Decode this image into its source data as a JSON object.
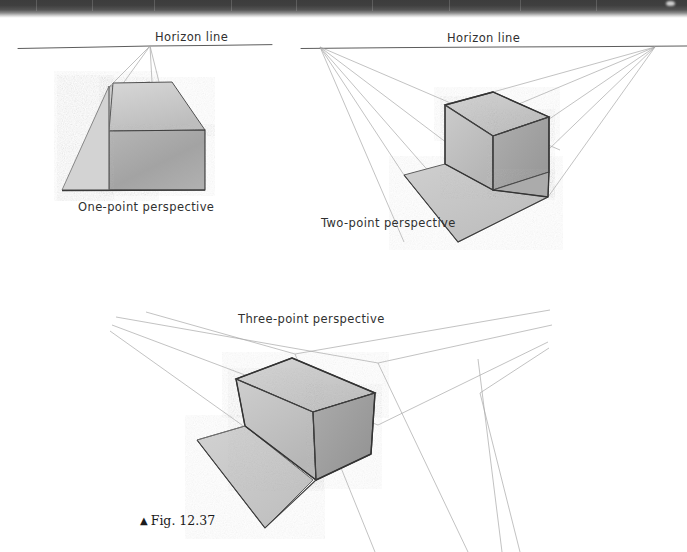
{
  "page": {
    "width": 687,
    "height": 552,
    "background": "#ffffff",
    "scan_edge_color": "#3c3c3c"
  },
  "figure": {
    "caption_marker": "▲",
    "caption_text": "Fig. 12.37",
    "caption_full": "▲ Fig. 12.37"
  },
  "diagrams": [
    {
      "id": "one-point",
      "label": "One-point perspective",
      "horizon_label": "Horizon line",
      "vanishing_points": 1,
      "label_x": 78,
      "label_y": 202,
      "horizon_label_x": 155,
      "horizon_label_y": 30
    },
    {
      "id": "two-point",
      "label": "Two-point perspective",
      "horizon_label": "Horizon line",
      "vanishing_points": 2,
      "label_x": 321,
      "label_y": 218,
      "horizon_label_x": 447,
      "horizon_label_y": 31
    },
    {
      "id": "three-point",
      "label": "Three-point perspective",
      "horizon_label": null,
      "vanishing_points": 3,
      "label_x": 240,
      "label_y": 313
    }
  ],
  "palette": {
    "paper": "#ffffff",
    "pencil_line": "#3a3a3a",
    "construction_line": "#9a9a9a",
    "face_light": "#d2d2d2",
    "face_mid": "#bfbfbf",
    "face_dark": "#a8a8a8",
    "face_darker": "#9c9c9c",
    "ground_plane": "#c6c6c6",
    "ink": "#2b2b2b"
  },
  "shading": {
    "one_point_top_face": "#c9c9c9",
    "one_point_front_face": "#a9a9a9",
    "one_point_left_face": "#cfcfcf",
    "two_point_top_face": "#c6c6c6",
    "two_point_front_face": "#c0c0c0",
    "two_point_right_face": "#a6a6a6",
    "two_point_ground": "#c4c4c4",
    "three_point_top_face": "#cacaca",
    "three_point_front_face": "#c2c2c2",
    "three_point_right_face": "#a4a4a4",
    "three_point_ground": "#c8c8c8"
  }
}
